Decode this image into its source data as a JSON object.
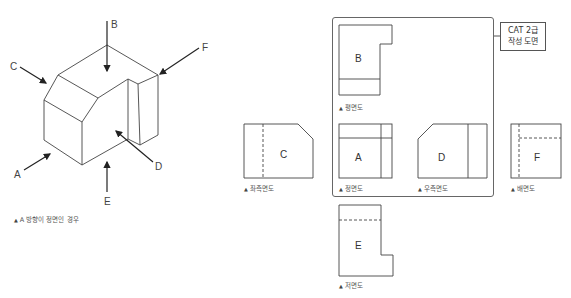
{
  "isometric": {
    "direction_labels": [
      "A",
      "B",
      "C",
      "D",
      "E",
      "F"
    ],
    "caption": "A 방향이 정면인 경우"
  },
  "frame_callout": {
    "line1": "CAT 2급",
    "line2": "작성 도면"
  },
  "views": {
    "plan": {
      "letter": "B",
      "label": "평면도"
    },
    "left_side": {
      "letter": "C",
      "label": "좌측면도"
    },
    "front": {
      "letter": "A",
      "label": "정면도"
    },
    "right_side": {
      "letter": "D",
      "label": "우측면도"
    },
    "rear": {
      "letter": "F",
      "label": "배면도"
    },
    "bottom": {
      "letter": "E",
      "label": "저면도"
    }
  },
  "colors": {
    "line": "#444444",
    "frame": "#666666",
    "text": "#555555"
  }
}
